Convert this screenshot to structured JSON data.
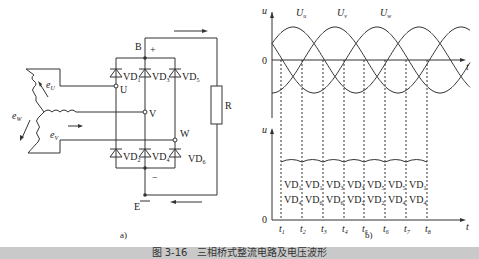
{
  "figure": {
    "caption": "图 3-16　三相桥式整流电路及电压波形",
    "caption_bar_color": "#c9c9c9",
    "line_color": "#333333"
  },
  "circuit": {
    "sublabel": "a)",
    "node_top": "B",
    "node_bottom": "E",
    "plus": "+",
    "minus": "−",
    "phase_terminals": [
      "U",
      "V",
      "W"
    ],
    "resistor": "R",
    "emf_labels": {
      "u": "e",
      "u_sub": "U",
      "v": "e",
      "v_sub": "V",
      "w": "e",
      "w_sub": "W"
    },
    "upper_diodes": [
      {
        "name": "VD",
        "sub": "1"
      },
      {
        "name": "VD",
        "sub": "3"
      },
      {
        "name": "VD",
        "sub": "5"
      }
    ],
    "lower_diodes": [
      {
        "name": "VD",
        "sub": "2"
      },
      {
        "name": "VD",
        "sub": "4"
      },
      {
        "name": "VD",
        "sub": "6"
      }
    ]
  },
  "chart_data": [
    {
      "type": "line",
      "title": "Three-phase input voltages",
      "xlabel": "t",
      "ylabel": "u",
      "origin_label": "0",
      "series": [
        {
          "name": "U",
          "sub": "u",
          "phase_deg": 0
        },
        {
          "name": "U",
          "sub": "v",
          "phase_deg": -120
        },
        {
          "name": "U",
          "sub": "w",
          "phase_deg": -240
        }
      ],
      "grid": false
    },
    {
      "type": "line",
      "title": "Rectified output voltage",
      "xlabel": "t",
      "ylabel": "u",
      "origin_label": "0",
      "time_marks": [
        "t1",
        "t2",
        "t3",
        "t4",
        "t5",
        "t6",
        "t7",
        "t8"
      ],
      "conducting_pairs": [
        [
          "VD1",
          "VD4"
        ],
        [
          "VD1",
          "VD6"
        ],
        [
          "VD3",
          "VD6"
        ],
        [
          "VD3",
          "VD2"
        ],
        [
          "VD5",
          "VD2"
        ],
        [
          "VD5",
          "VD4"
        ],
        [
          "VD1",
          "VD4"
        ]
      ],
      "ripple": "small ripple near peak line-voltage",
      "sublabel": "b)"
    }
  ]
}
